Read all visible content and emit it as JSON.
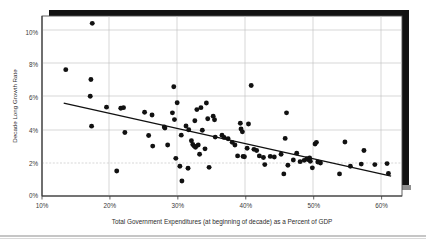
{
  "chart_data": {
    "type": "scatter",
    "title": "",
    "xlabel": "Total Government Expenditures (at beginning of decade) as a Percent of GDP",
    "ylabel": "Decade Long Growth Rate",
    "xlim": [
      10,
      63
    ],
    "ylim": [
      0,
      11
    ],
    "grid": true,
    "legend": null,
    "xticks": [
      "10%",
      "20%",
      "30%",
      "40%",
      "50%",
      "60%"
    ],
    "xtick_values": [
      10,
      20,
      30,
      40,
      50,
      60
    ],
    "yticks": [
      "0%",
      "2%",
      "4%",
      "6%",
      "8%",
      "10%"
    ],
    "ytick_values": [
      0,
      2,
      4,
      6,
      8,
      10
    ],
    "series": [
      {
        "name": "Countries by decade",
        "marker": "filled-circle",
        "color": "#111111",
        "points": [
          [
            13.5,
            7.72
          ],
          [
            17.4,
            10.55
          ],
          [
            17.2,
            7.12
          ],
          [
            17.1,
            6.1
          ],
          [
            17.3,
            4.27
          ],
          [
            19.5,
            5.43
          ],
          [
            21.0,
            1.53
          ],
          [
            21.6,
            5.36
          ],
          [
            22.0,
            5.4
          ],
          [
            22.2,
            3.88
          ],
          [
            25.1,
            5.12
          ],
          [
            25.7,
            3.7
          ],
          [
            26.2,
            4.95
          ],
          [
            26.3,
            3.05
          ],
          [
            28.0,
            4.22
          ],
          [
            28.1,
            4.15
          ],
          [
            28.5,
            3.12
          ],
          [
            29.2,
            5.08
          ],
          [
            29.4,
            6.68
          ],
          [
            29.5,
            4.67
          ],
          [
            29.7,
            2.3
          ],
          [
            29.9,
            5.7
          ],
          [
            30.3,
            1.82
          ],
          [
            30.5,
            3.72
          ],
          [
            30.6,
            0.92
          ],
          [
            31.2,
            4.28
          ],
          [
            31.5,
            1.7
          ],
          [
            31.6,
            4.05
          ],
          [
            32.0,
            3.38
          ],
          [
            32.2,
            3.15
          ],
          [
            32.4,
            3.05
          ],
          [
            32.5,
            4.6
          ],
          [
            32.6,
            2.98
          ],
          [
            32.8,
            5.28
          ],
          [
            33.0,
            3.12
          ],
          [
            33.2,
            2.55
          ],
          [
            33.4,
            5.4
          ],
          [
            33.6,
            4.02
          ],
          [
            34.0,
            2.88
          ],
          [
            34.2,
            5.68
          ],
          [
            34.4,
            4.72
          ],
          [
            34.6,
            1.75
          ],
          [
            35.2,
            4.88
          ],
          [
            35.4,
            4.66
          ],
          [
            35.5,
            3.6
          ],
          [
            36.5,
            3.72
          ],
          [
            36.8,
            3.58
          ],
          [
            37.4,
            3.5
          ],
          [
            38.0,
            3.28
          ],
          [
            38.4,
            3.12
          ],
          [
            38.8,
            2.45
          ],
          [
            39.2,
            4.45
          ],
          [
            39.3,
            4.1
          ],
          [
            39.5,
            3.92
          ],
          [
            39.6,
            2.42
          ],
          [
            39.8,
            2.4
          ],
          [
            40.2,
            2.92
          ],
          [
            40.4,
            4.4
          ],
          [
            40.8,
            6.75
          ],
          [
            41.2,
            2.85
          ],
          [
            41.6,
            2.78
          ],
          [
            42.0,
            2.45
          ],
          [
            42.6,
            2.35
          ],
          [
            42.8,
            1.92
          ],
          [
            43.6,
            2.42
          ],
          [
            44.2,
            2.38
          ],
          [
            45.2,
            2.55
          ],
          [
            45.6,
            1.35
          ],
          [
            45.8,
            3.52
          ],
          [
            46.0,
            5.08
          ],
          [
            46.2,
            1.88
          ],
          [
            47.0,
            2.2
          ],
          [
            47.5,
            2.62
          ],
          [
            48.0,
            2.1
          ],
          [
            48.6,
            2.18
          ],
          [
            49.0,
            2.28
          ],
          [
            49.2,
            2.22
          ],
          [
            49.4,
            2.32
          ],
          [
            49.5,
            2.12
          ],
          [
            49.8,
            1.72
          ],
          [
            50.2,
            3.18
          ],
          [
            50.4,
            3.28
          ],
          [
            50.6,
            2.08
          ],
          [
            51.0,
            2.02
          ],
          [
            53.8,
            1.35
          ],
          [
            54.6,
            3.3
          ],
          [
            55.4,
            1.82
          ],
          [
            57.0,
            1.95
          ],
          [
            57.4,
            2.78
          ],
          [
            59.0,
            1.92
          ],
          [
            60.8,
            1.98
          ],
          [
            61.0,
            1.38
          ]
        ]
      }
    ],
    "trendline": {
      "name": "linear-fit",
      "color": "#111111",
      "x_start": 13.2,
      "y_start": 5.68,
      "x_end": 61.4,
      "y_end": 1.22
    }
  },
  "frame": {
    "shadow_color": "#111111",
    "border_color": "#4a4a4a",
    "grid_color": "#b9b9b9",
    "footer_rule_color": "#8d8d8d"
  }
}
